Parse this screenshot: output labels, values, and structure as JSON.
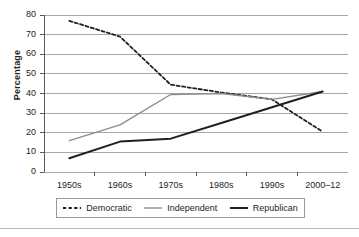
{
  "chart_data": {
    "type": "line",
    "title": "",
    "xlabel": "",
    "ylabel": "Percentage",
    "categories": [
      "1950s",
      "1960s",
      "1970s",
      "1980s",
      "1990s",
      "2000–12"
    ],
    "ylim": [
      0,
      80
    ],
    "yticks": [
      0,
      10,
      20,
      30,
      40,
      50,
      60,
      70,
      80
    ],
    "grid": true,
    "legend_position": "bottom",
    "series": [
      {
        "name": "Democratic",
        "values": [
          77,
          69,
          44.5,
          40.5,
          37,
          20.5
        ],
        "style": "dashed",
        "color": "#231f20",
        "width": 1.8
      },
      {
        "name": "Independent",
        "values": [
          16,
          24,
          39.5,
          40,
          37,
          41
        ],
        "style": "solid",
        "color": "#8c8c8c",
        "width": 1.4
      },
      {
        "name": "Republican",
        "values": [
          7,
          15.5,
          17,
          25,
          33,
          41
        ],
        "style": "solid",
        "color": "#231f20",
        "width": 2.0
      }
    ]
  },
  "axis": {
    "ylabel": "Percentage",
    "ytick_labels": [
      "80",
      "70",
      "60",
      "50",
      "40",
      "30",
      "20",
      "10",
      "0"
    ],
    "xtick_labels": [
      "1950s",
      "1960s",
      "1970s",
      "1980s",
      "1990s",
      "2000–12"
    ]
  },
  "legend": {
    "items": [
      {
        "label": "Democratic",
        "style": "dashed",
        "color": "#231f20"
      },
      {
        "label": "Independent",
        "style": "solid",
        "color": "#8c8c8c"
      },
      {
        "label": "Republican",
        "style": "solid",
        "color": "#231f20"
      }
    ]
  },
  "colors": {
    "grid": "#a8a8a8",
    "axis": "#5a5a5a",
    "text": "#231f20",
    "legend_border": "#9a9a9a",
    "rule": "#b9b9b9",
    "background": "#ffffff"
  }
}
